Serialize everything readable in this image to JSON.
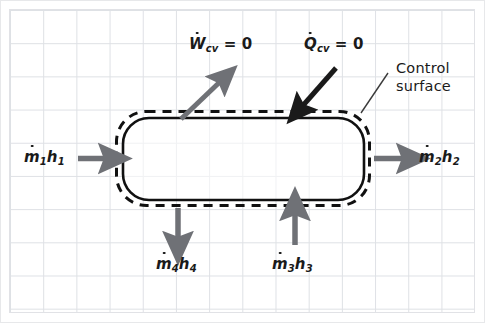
{
  "figure": {
    "type": "thermodynamic-control-volume-diagram",
    "background": "graph-paper-grid",
    "grid_color": "#d9dce1",
    "grid_spacing_px": 33,
    "canvas": {
      "width": 485,
      "height": 323
    }
  },
  "control_volume": {
    "device_outline": {
      "name": "solid-rounded-rectangle",
      "stroke": "#111111",
      "x": 122,
      "y": 117,
      "width": 242,
      "height": 83
    },
    "control_surface_outline": {
      "name": "dashed-rounded-rectangle",
      "stroke": "#111111",
      "style": "dashed",
      "x": 116,
      "y": 111,
      "width": 254,
      "height": 95
    }
  },
  "labels": {
    "work": {
      "symbol": "W",
      "subscript": "cv",
      "equals": "= 0",
      "full_text": "Wcv = 0",
      "arrow_direction": "out-up-right",
      "arrow_color": "#6f7176"
    },
    "heat": {
      "symbol": "Q",
      "subscript": "cv",
      "equals": "= 0",
      "full_text": "Qcv = 0",
      "arrow_direction": "in-down-left",
      "arrow_color": "#1a1a1a"
    },
    "control_surface": {
      "line1": "Control",
      "line2": "surface",
      "leader_line": true,
      "leader_color": "#3a3a3a"
    },
    "stream_1": {
      "mdot": "m",
      "mdot_sub": "1",
      "h": "h",
      "h_sub": "1",
      "full_text": "m1h1",
      "direction": "inlet-left",
      "arrow_color": "#6f7176"
    },
    "stream_2": {
      "mdot": "m",
      "mdot_sub": "2",
      "h": "h",
      "h_sub": "2",
      "full_text": "m2h2",
      "direction": "outlet-right",
      "arrow_color": "#6f7176"
    },
    "stream_3": {
      "mdot": "m",
      "mdot_sub": "3",
      "h": "h",
      "h_sub": "3",
      "full_text": "m3h3",
      "direction": "inlet-bottom-up",
      "arrow_color": "#6f7176"
    },
    "stream_4": {
      "mdot": "m",
      "mdot_sub": "4",
      "h": "h",
      "h_sub": "4",
      "full_text": "m4h4",
      "direction": "outlet-bottom-down",
      "arrow_color": "#6f7176"
    }
  },
  "colors": {
    "ink": "#1a1a1a",
    "gray_arrow": "#6f7176",
    "black_arrow": "#1a1a1a",
    "grid": "#d9dce1",
    "paper": "#ffffff"
  }
}
